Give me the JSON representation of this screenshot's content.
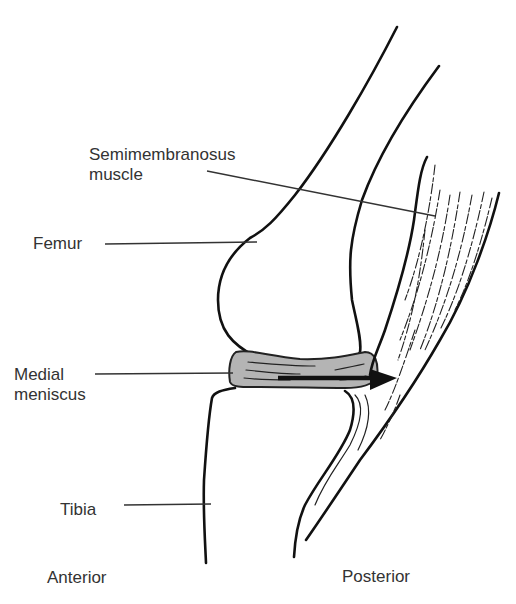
{
  "diagram": {
    "labels": {
      "semimembranosus_line1": "Semimembranosus",
      "semimembranosus_line2": "muscle",
      "femur": "Femur",
      "medial_line1": "Medial",
      "medial_line2": "meniscus",
      "tibia": "Tibia",
      "anterior": "Anterior",
      "posterior": "Posterior"
    },
    "colors": {
      "line": "#111111",
      "meniscus_fill": "#b4b4b4",
      "background": "#ffffff"
    }
  }
}
